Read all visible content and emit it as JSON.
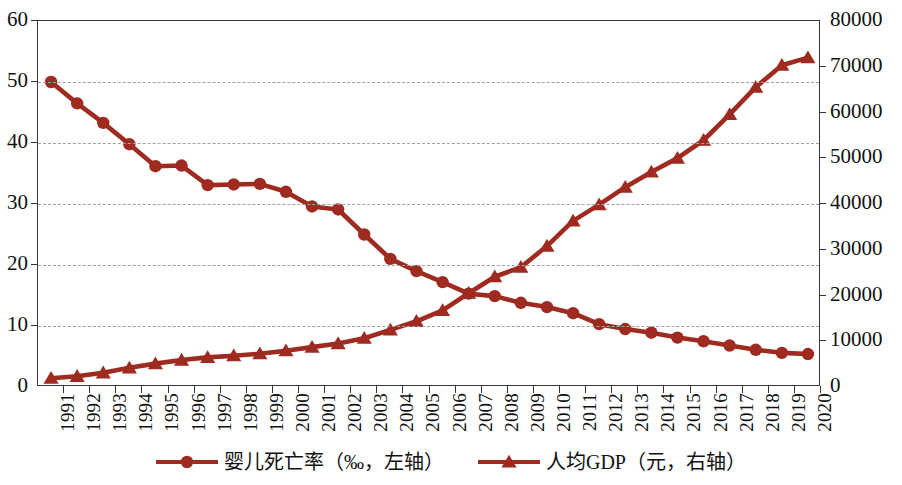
{
  "chart_data": {
    "type": "line",
    "title": "",
    "xlabel": "",
    "grid": "horizontal",
    "legend_position": "bottom-center",
    "accent_color": "#9e2a20",
    "categories": [
      "1991",
      "1992",
      "1993",
      "1994",
      "1995",
      "1996",
      "1997",
      "1998",
      "1999",
      "2000",
      "2001",
      "2002",
      "2003",
      "2004",
      "2005",
      "2006",
      "2007",
      "2008",
      "2009",
      "2010",
      "2011",
      "2012",
      "2013",
      "2014",
      "2015",
      "2016",
      "2017",
      "2018",
      "2019",
      "2020"
    ],
    "axes": {
      "left": {
        "label": "婴儿死亡率（‰）",
        "min": 0,
        "max": 60,
        "step": 10,
        "ticks": [
          "0",
          "10",
          "20",
          "30",
          "40",
          "50",
          "60"
        ]
      },
      "right": {
        "label": "人均GDP（元）",
        "min": 0,
        "max": 80000,
        "step": 10000,
        "ticks": [
          "0",
          "10000",
          "20000",
          "30000",
          "40000",
          "50000",
          "60000",
          "70000",
          "80000"
        ]
      }
    },
    "series": [
      {
        "name": "婴儿死亡率（‰，左轴）",
        "axis": "left",
        "marker": "circle",
        "color": "#9e2a20",
        "values": [
          50.0,
          46.5,
          43.3,
          39.8,
          36.2,
          36.3,
          33.1,
          33.2,
          33.3,
          32.0,
          29.6,
          29.1,
          25.0,
          21.0,
          19.0,
          17.2,
          15.3,
          14.9,
          13.8,
          13.1,
          12.1,
          10.3,
          9.5,
          8.9,
          8.1,
          7.5,
          6.8,
          6.1,
          5.6,
          5.4
        ],
        "last_value": 5.4,
        "first_value": 50.0
      },
      {
        "name": "人均GDP（元，右轴）",
        "axis": "right",
        "marker": "triangle",
        "color": "#9e2a20",
        "values": [
          1912,
          2334,
          3108,
          4190,
          5112,
          5898,
          6481,
          6835,
          7271,
          7942,
          8717,
          9506,
          10666,
          12487,
          14368,
          16738,
          20494,
          24100,
          26180,
          30808,
          36302,
          39874,
          43684,
          47005,
          50028,
          53935,
          59592,
          65534,
          70328,
          72000
        ],
        "first_value": 1912,
        "last_value": 72000
      }
    ],
    "crossover": {
      "year": "2007",
      "left_value": 15.3,
      "right_value": 20494
    }
  },
  "legend": {
    "entries": [
      {
        "label": "婴儿死亡率（‰，左轴）",
        "marker": "circle"
      },
      {
        "label": "人均GDP（元，右轴）",
        "marker": "triangle"
      }
    ]
  }
}
